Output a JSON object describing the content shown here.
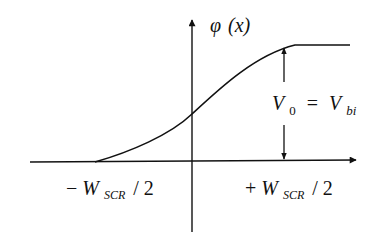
{
  "diagram": {
    "y_axis_label": {
      "symbol": "φ",
      "arg": "(x)"
    },
    "x_tick_left": {
      "sign": "−",
      "main": "W",
      "sub": "SCR",
      "suffix": "/ 2"
    },
    "x_tick_right": {
      "sign": "+",
      "main": "W",
      "sub": "SCR",
      "suffix": "/ 2"
    },
    "height_annotation": {
      "lhs_main": "V",
      "lhs_sub": "0",
      "eq": "=",
      "rhs_main": "V",
      "rhs_sub": "bi"
    },
    "colors": {
      "ink": "#111111",
      "background": "#ffffff"
    }
  }
}
